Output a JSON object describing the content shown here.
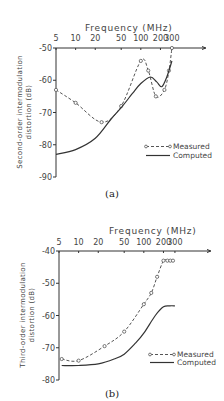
{
  "chart_data": [
    {
      "id": "a",
      "type": "line",
      "caption": "(a)",
      "title": "Frequency (MHz)",
      "xlabel": "Frequency (MHz)",
      "ylabel_line1": "Second-order intermodulation",
      "ylabel_line2": "distortion (dB)",
      "xscale": "log",
      "x_ticks": [
        5,
        10,
        20,
        50,
        100,
        200,
        300
      ],
      "x_tick_labels": [
        "5",
        "10",
        "20",
        "50",
        "100",
        "200",
        "300"
      ],
      "y_ticks": [
        -50,
        -60,
        -70,
        -80,
        -90
      ],
      "y_tick_labels": [
        "-50",
        "-60",
        "-70",
        "-80",
        "-90"
      ],
      "ylim": [
        -90,
        -50
      ],
      "xlim": [
        5,
        300
      ],
      "grid": false,
      "legend_position": "lower right",
      "series": [
        {
          "name": "Measured",
          "style": "dashed-with-circles",
          "x": [
            5,
            10,
            25,
            50,
            100,
            130,
            170,
            230,
            270,
            300
          ],
          "y": [
            -63,
            -67,
            -73,
            -68,
            -54,
            -57,
            -65,
            -63,
            -57,
            -50
          ]
        },
        {
          "name": "Computed",
          "style": "solid",
          "x": [
            5,
            10,
            20,
            35,
            50,
            75,
            100,
            140,
            175,
            210,
            250,
            300
          ],
          "y": [
            -83,
            -81.5,
            -78,
            -72,
            -68.5,
            -64,
            -61,
            -59,
            -60.5,
            -62,
            -59,
            -54
          ]
        }
      ]
    },
    {
      "id": "b",
      "type": "line",
      "caption": "(b)",
      "title": "Frequency (MHz)",
      "xlabel": "Frequency (MHz)",
      "ylabel_line1": "Third-order intermodulation",
      "ylabel_line2": "distortion (dB)",
      "xscale": "log",
      "x_ticks": [
        5,
        10,
        20,
        50,
        100,
        200,
        300
      ],
      "x_tick_labels": [
        "5",
        "10",
        "20",
        "50",
        "100",
        "200",
        "300"
      ],
      "y_ticks": [
        -40,
        -50,
        -60,
        -70,
        -80
      ],
      "y_tick_labels": [
        "-40",
        "-50",
        "-60",
        "-70",
        "-80"
      ],
      "ylim": [
        -80,
        -40
      ],
      "xlim": [
        5,
        300
      ],
      "grid": false,
      "legend_position": "lower right",
      "series": [
        {
          "name": "Measured",
          "style": "dashed-with-circles",
          "x": [
            5.5,
            10,
            25,
            50,
            100,
            130,
            160,
            200,
            230,
            255,
            280
          ],
          "y": [
            -73.5,
            -74,
            -69.5,
            -65,
            -56.5,
            -53,
            -48,
            -43,
            -43,
            -43,
            -43
          ]
        },
        {
          "name": "Computed",
          "style": "solid",
          "x": [
            5.5,
            10,
            20,
            35,
            50,
            75,
            100,
            150,
            200,
            250,
            300
          ],
          "y": [
            -75.5,
            -75.5,
            -75,
            -73.5,
            -72,
            -68.5,
            -65.5,
            -60,
            -57.3,
            -57,
            -57
          ]
        }
      ]
    }
  ]
}
